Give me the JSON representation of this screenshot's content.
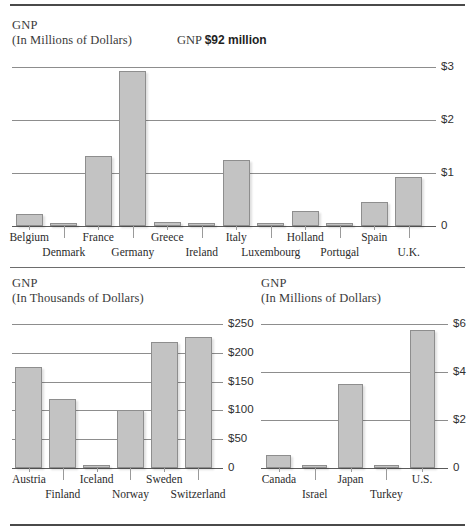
{
  "rules": {
    "top": true,
    "middle": true,
    "bottom": true
  },
  "charts": {
    "europe": {
      "title": "GNP",
      "subtitle": "(In Thousands of Dollars)",
      "subtitle_actual": "(In Millions of Dollars)",
      "annotation_prefix": "GNP",
      "annotation_value": "$92 million"
    },
    "nordic": {
      "title": "GNP",
      "subtitle": "(In Thousands of Dollars)"
    },
    "world": {
      "title": "GNP",
      "subtitle": "(In Millions of Dollars)"
    }
  },
  "chart_data": [
    {
      "id": "europe",
      "type": "bar",
      "title": "GNP",
      "subtitle": "(In Millions of Dollars)",
      "annotation": "GNP $92 million",
      "xlabel": "",
      "ylabel": "",
      "ylim": [
        0,
        3.25
      ],
      "yticks": [
        0,
        1,
        2,
        3
      ],
      "ytick_labels": [
        "0",
        "$1",
        "$2",
        "$3"
      ],
      "grid": true,
      "legend": "none",
      "categories": [
        "Belgium",
        "Denmark",
        "France",
        "Germany",
        "Greece",
        "Ireland",
        "Italy",
        "Luxembourg",
        "Holland",
        "Portugal",
        "Spain",
        "U.K."
      ],
      "values": [
        0.23,
        0.02,
        1.33,
        2.92,
        0.08,
        0.05,
        1.25,
        0.01,
        0.28,
        0.06,
        0.46,
        0.92
      ]
    },
    {
      "id": "nordic",
      "type": "bar",
      "title": "GNP",
      "subtitle": "(In Thousands of Dollars)",
      "xlabel": "",
      "ylabel": "",
      "ylim": [
        0,
        262
      ],
      "yticks": [
        0,
        50,
        100,
        150,
        200,
        250
      ],
      "ytick_labels": [
        "0",
        "$50",
        "$100",
        "$150",
        "$200",
        "$250"
      ],
      "grid": true,
      "legend": "none",
      "categories": [
        "Austria",
        "Finland",
        "Iceland",
        "Norway",
        "Sweden",
        "Switzerland"
      ],
      "values": [
        175,
        120,
        5,
        100,
        218,
        228
      ]
    },
    {
      "id": "world",
      "type": "bar",
      "title": "GNP",
      "subtitle": "(In Millions of Dollars)",
      "xlabel": "",
      "ylabel": "",
      "ylim": [
        0,
        6.3
      ],
      "yticks": [
        0,
        2,
        4,
        6
      ],
      "ytick_labels": [
        "0",
        "$2",
        "$4",
        "$6"
      ],
      "grid": true,
      "legend": "none",
      "categories": [
        "Canada",
        "Israel",
        "Japan",
        "Turkey",
        "U.S."
      ],
      "values": [
        0.55,
        0.06,
        3.5,
        0.1,
        5.75
      ]
    }
  ],
  "colors": {
    "bar_fill": "#c3c3c3",
    "bar_stroke": "#8e8e8e",
    "gridline": "#8d8d8d",
    "rule": "#4a4a4a",
    "text": "#2b2b2b"
  }
}
